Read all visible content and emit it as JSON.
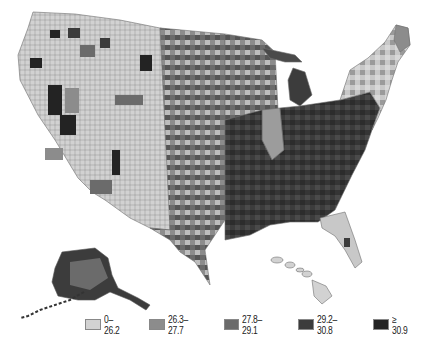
{
  "map": {
    "type": "choropleth",
    "region": "United States counties",
    "insets": [
      "Alaska",
      "Hawaii"
    ],
    "colors": {
      "class1": "#d2d2d2",
      "class2": "#8c8c8c",
      "class3": "#6b6b6b",
      "class4": "#3c3c3c",
      "class5": "#232323",
      "border": "#6f6f6f",
      "background": "#ffffff"
    }
  },
  "legend": {
    "items": [
      {
        "label": "0–26.2",
        "color": "#d2d2d2"
      },
      {
        "label": "26.3–27.7",
        "color": "#8c8c8c"
      },
      {
        "label": "27.8–29.1",
        "color": "#6b6b6b"
      },
      {
        "label": "29.2–30.8",
        "color": "#3c3c3c"
      },
      {
        "label": "≥ 30.9",
        "color": "#232323"
      }
    ]
  }
}
